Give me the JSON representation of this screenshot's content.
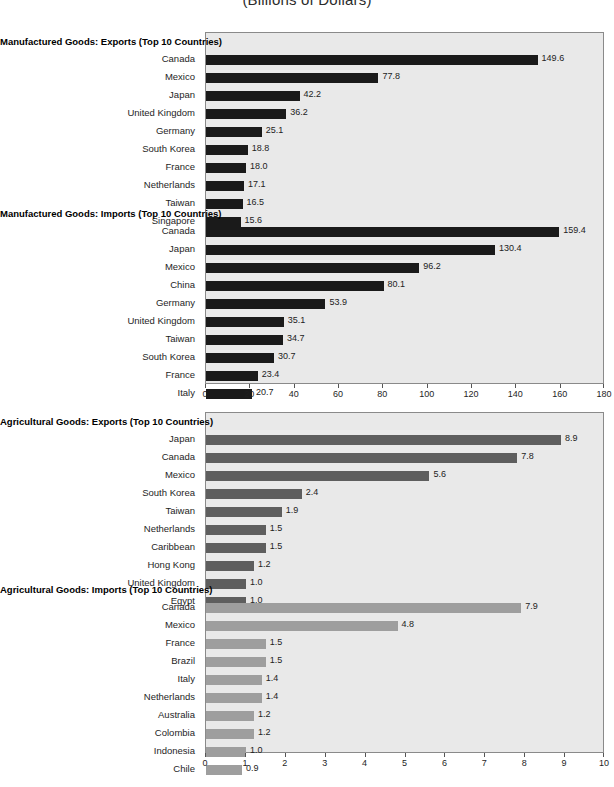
{
  "title": "(Billions of Dollars)",
  "colors": {
    "panel_bg": "#e9e9e9",
    "panel_border": "#8a8a8a",
    "bar_dark": "#1a1a1a",
    "bar_mid": "#5e5e5e",
    "bar_light": "#9e9e9e",
    "text": "#1e1e1e"
  },
  "chart_data": [
    {
      "type": "bar",
      "orientation": "horizontal",
      "title": "Manufactured Goods: Exports (Top 10 Countries)",
      "panel": "manufactured",
      "xlabel": "",
      "ylabel": "",
      "xlim": [
        0,
        180
      ],
      "xticks": [
        0,
        20,
        40,
        60,
        80,
        100,
        120,
        140,
        160,
        180
      ],
      "grid": false,
      "legend": "none",
      "bar_color": "#1a1a1a",
      "categories": [
        "Canada",
        "Mexico",
        "Japan",
        "United Kingdom",
        "Germany",
        "South Korea",
        "France",
        "Netherlands",
        "Taiwan",
        "Singapore"
      ],
      "values": [
        149.6,
        77.8,
        42.2,
        36.2,
        25.1,
        18.8,
        18.0,
        17.1,
        16.5,
        15.6
      ],
      "labels": [
        "149.6",
        "77.8",
        "42.2",
        "36.2",
        "25.1",
        "18.8",
        "18.0",
        "17.1",
        "16.5",
        "15.6"
      ]
    },
    {
      "type": "bar",
      "orientation": "horizontal",
      "title": "Manufactured Goods: Imports (Top 10 Countries)",
      "panel": "manufactured",
      "xlabel": "",
      "ylabel": "",
      "xlim": [
        0,
        180
      ],
      "xticks": [
        0,
        20,
        40,
        60,
        80,
        100,
        120,
        140,
        160,
        180
      ],
      "grid": false,
      "legend": "none",
      "bar_color": "#1a1a1a",
      "categories": [
        "Canada",
        "Japan",
        "Mexico",
        "China",
        "Germany",
        "United Kingdom",
        "Taiwan",
        "South Korea",
        "France",
        "Italy"
      ],
      "values": [
        159.4,
        130.4,
        96.2,
        80.1,
        53.9,
        35.1,
        34.7,
        30.7,
        23.4,
        20.7
      ],
      "labels": [
        "159.4",
        "130.4",
        "96.2",
        "80.1",
        "53.9",
        "35.1",
        "34.7",
        "30.7",
        "23.4",
        "20.7"
      ]
    },
    {
      "type": "bar",
      "orientation": "horizontal",
      "title": "Agricultural Goods: Exports (Top 10 Countries)",
      "panel": "agricultural",
      "xlabel": "",
      "ylabel": "",
      "xlim": [
        0,
        10
      ],
      "xticks": [
        0,
        1,
        2,
        3,
        4,
        5,
        6,
        7,
        8,
        9,
        10
      ],
      "grid": false,
      "legend": "none",
      "bar_color": "#5e5e5e",
      "categories": [
        "Japan",
        "Canada",
        "Mexico",
        "South Korea",
        "Taiwan",
        "Netherlands",
        "Caribbean",
        "Hong Kong",
        "United Kingdom",
        "Egypt"
      ],
      "values": [
        8.9,
        7.8,
        5.6,
        2.4,
        1.9,
        1.5,
        1.5,
        1.2,
        1.0,
        1.0
      ],
      "labels": [
        "8.9",
        "7.8",
        "5.6",
        "2.4",
        "1.9",
        "1.5",
        "1.5",
        "1.2",
        "1.0",
        "1.0"
      ]
    },
    {
      "type": "bar",
      "orientation": "horizontal",
      "title": "Agricultural Goods: Imports (Top 10 Countries)",
      "panel": "agricultural",
      "xlabel": "",
      "ylabel": "",
      "xlim": [
        0,
        10
      ],
      "xticks": [
        0,
        1,
        2,
        3,
        4,
        5,
        6,
        7,
        8,
        9,
        10
      ],
      "grid": false,
      "legend": "none",
      "bar_color": "#9e9e9e",
      "categories": [
        "Canada",
        "Mexico",
        "France",
        "Brazil",
        "Italy",
        "Netherlands",
        "Australia",
        "Colombia",
        "Indonesia",
        "Chile"
      ],
      "values": [
        7.9,
        4.8,
        1.5,
        1.5,
        1.4,
        1.4,
        1.2,
        1.2,
        1.0,
        0.9
      ],
      "labels": [
        "7.9",
        "4.8",
        "1.5",
        "1.5",
        "1.4",
        "1.4",
        "1.2",
        "1.2",
        "1.0",
        "0.9"
      ]
    }
  ],
  "panels": [
    {
      "name": "manufactured",
      "xmax": 180,
      "tick_labels": [
        "0",
        "20",
        "40",
        "60",
        "80",
        "100",
        "120",
        "140",
        "160",
        "180"
      ]
    },
    {
      "name": "agricultural",
      "xmax": 10,
      "tick_labels": [
        "0",
        "1",
        "2",
        "3",
        "4",
        "5",
        "6",
        "7",
        "8",
        "9",
        "10"
      ]
    }
  ]
}
